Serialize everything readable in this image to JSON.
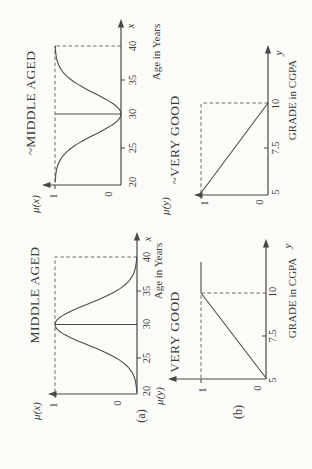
{
  "figure": {
    "panel_a": "(a)",
    "panel_b": "(b)"
  },
  "chart_data": [
    {
      "id": "middle_aged",
      "type": "line",
      "panel": "a",
      "title": "MIDDLE AGED",
      "xlabel": "Age in Years",
      "ylabel": "μ(x)",
      "x_axis_arrow_label": "x",
      "x_ticks": [
        "20",
        "25",
        "30",
        "35",
        "40"
      ],
      "y_ticks": [
        "0",
        "1"
      ],
      "x_range": [
        20,
        40
      ],
      "y_range": [
        0,
        1
      ],
      "curve": {
        "kind": "gaussian",
        "center": 30,
        "sigma": 3,
        "peak": 1,
        "description": "Bell-shaped membership function: ~0 at age 20, peak 1 at age 30, ~0 at age 40"
      },
      "guides": {
        "solid_vline_x": 30,
        "dashed_hline": {
          "mu": 1,
          "x_from": 20,
          "x_to": 40
        },
        "dashed_vline": {
          "x": 40,
          "mu_from": 0,
          "mu_to": 1
        }
      }
    },
    {
      "id": "not_middle_aged",
      "type": "line",
      "panel": "a",
      "title": "~MIDDLE AGED",
      "xlabel": "Age in Years",
      "ylabel": "μ(x)",
      "x_axis_arrow_label": "x",
      "x_ticks": [
        "20",
        "25",
        "30",
        "35",
        "40"
      ],
      "y_ticks": [
        "0",
        "1"
      ],
      "x_range": [
        20,
        40
      ],
      "y_range": [
        0,
        1
      ],
      "curve": {
        "kind": "gaussian_complement",
        "center": 30,
        "sigma": 3,
        "peak": 1,
        "description": "Complement of MIDDLE AGED: 1 at ages 20 and 40, dips to 0 at age 30"
      },
      "guides": {
        "solid_vline_x": 30,
        "dashed_hline": {
          "mu": 1,
          "x_from": 20,
          "x_to": 40
        },
        "dashed_vline": {
          "x": 40,
          "mu_from": 0,
          "mu_to": 1
        }
      }
    },
    {
      "id": "very_good",
      "type": "line",
      "panel": "b",
      "title": "VERY GOOD",
      "xlabel": "GRADE in CGPA",
      "ylabel": "μ(y)",
      "x_axis_arrow_label": "y",
      "x_ticks": [
        "5",
        "7.5",
        "10"
      ],
      "y_ticks": [
        "0",
        "1"
      ],
      "x_range": [
        5,
        10
      ],
      "y_range": [
        0,
        1
      ],
      "curve": {
        "kind": "polyline",
        "points": [
          [
            5,
            0
          ],
          [
            10,
            1
          ],
          [
            11.8,
            1
          ]
        ],
        "description": "Linear ramp from (5,0) to (10,1), then constant 1 beyond grade 10"
      },
      "guides": {
        "dashed_hline": {
          "mu": 1,
          "x_from": 5,
          "x_to": 10
        },
        "dashed_vline": {
          "x": 10,
          "mu_from": 0,
          "mu_to": 1
        }
      }
    },
    {
      "id": "not_very_good",
      "type": "line",
      "panel": "b",
      "title": "~VERY GOOD",
      "xlabel": "GRADE in CGPA",
      "ylabel": "μ(y)",
      "x_axis_arrow_label": "y",
      "x_ticks": [
        "5",
        "7.5",
        "10"
      ],
      "y_ticks": [
        "0",
        "1"
      ],
      "x_range": [
        5,
        10
      ],
      "y_range": [
        0,
        1
      ],
      "curve": {
        "kind": "polyline",
        "points": [
          [
            5,
            1
          ],
          [
            10,
            0
          ]
        ],
        "description": "Complement of VERY GOOD: linear ramp from (5,1) down to (10,0)"
      },
      "guides": {
        "dashed_hline": {
          "mu": 1,
          "x_from": 5,
          "x_to": 10
        },
        "dashed_vline": {
          "x": 10,
          "mu_from": 0,
          "mu_to": 1
        }
      }
    }
  ]
}
